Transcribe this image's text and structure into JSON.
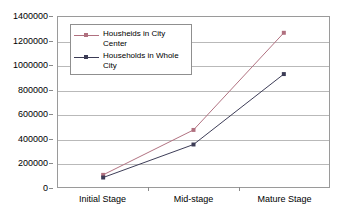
{
  "chart_data": {
    "type": "line",
    "title": "",
    "subtitle": "",
    "xlabel": "",
    "ylabel": "",
    "categories": [
      "Initial Stage",
      "Mid-stage",
      "Mature Stage"
    ],
    "ylim": [
      0,
      1400000
    ],
    "ytick_step": 200000,
    "yticks": [
      0,
      200000,
      400000,
      600000,
      800000,
      1000000,
      1200000,
      1400000
    ],
    "ytick_labels": [
      "0",
      "200000",
      "400000",
      "600000",
      "800000",
      "1000000",
      "1200000",
      "1400000"
    ],
    "grid": "horizontal",
    "legend_position": "top-left-inside",
    "series": [
      {
        "name": "Housheids in City Center",
        "values": [
          100000,
          470000,
          1270000
        ],
        "color": "#b0707f",
        "marker": "square"
      },
      {
        "name": "Households in Whole City",
        "values": [
          78000,
          350000,
          930000
        ],
        "color": "#3b3b55",
        "marker": "square"
      }
    ]
  },
  "legend": {
    "entries": [
      {
        "label": "Housheids in City Center"
      },
      {
        "label": "Households in Whole City"
      }
    ]
  },
  "axes": {
    "y_labels": [
      "1400000",
      "1200000",
      "1000000",
      "800000",
      "600000",
      "400000",
      "200000",
      "0"
    ],
    "x_labels": [
      "Initial Stage",
      "Mid-stage",
      "Mature Stage"
    ]
  },
  "colors": {
    "series_1": "#b0707f",
    "series_2": "#3b3b55",
    "gridline": "#b9b9b9",
    "frame": "#9a9a9a",
    "background": "#ffffff"
  }
}
